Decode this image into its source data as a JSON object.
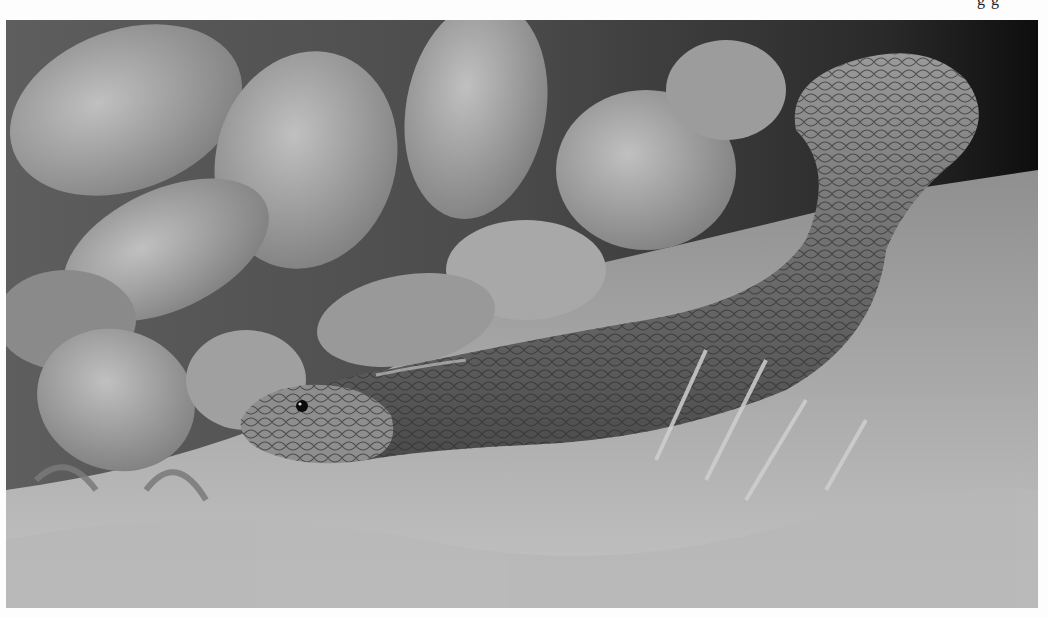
{
  "page": {
    "cut_top_text": "g g",
    "photo": {
      "subject": "snake",
      "description": "Grayscale photograph of a snake emerging from leafy plants onto sandy ground",
      "tone": "grayscale",
      "colors": {
        "background_dark": "#1a1a1a",
        "leaf_light": "#b5b5b5",
        "leaf_mid": "#8c8c8c",
        "snake_body": "#7a7a7a",
        "snake_belly": "#a8a8a8",
        "ground": "#9e9e9e",
        "page": "#fdfdfd"
      }
    }
  }
}
